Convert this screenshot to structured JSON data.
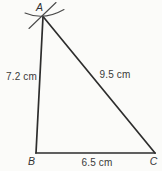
{
  "diagram": {
    "type": "triangle-construction",
    "colors": {
      "background": "#fbfbf9",
      "line": "#2d2d2d",
      "construction_mark": "#4a4a4a",
      "text": "#3a3a3a"
    },
    "vertices": [
      {
        "name": "A",
        "label": "A",
        "x": 43,
        "y": 16.5
      },
      {
        "name": "B",
        "label": "B",
        "x": 36,
        "y": 153
      },
      {
        "name": "C",
        "label": "C",
        "x": 155,
        "y": 153
      }
    ],
    "sides": [
      {
        "name": "AB",
        "label": "7.2 cm",
        "from": "A",
        "to": "B"
      },
      {
        "name": "AC",
        "label": "9.5 cm",
        "from": "A",
        "to": "C"
      },
      {
        "name": "BC",
        "label": "6.5 cm",
        "from": "B",
        "to": "C"
      }
    ],
    "construction_marks": [
      {
        "name": "compass-arc",
        "at_vertex": "A"
      },
      {
        "name": "compass-slash",
        "at_vertex": "A"
      }
    ]
  }
}
